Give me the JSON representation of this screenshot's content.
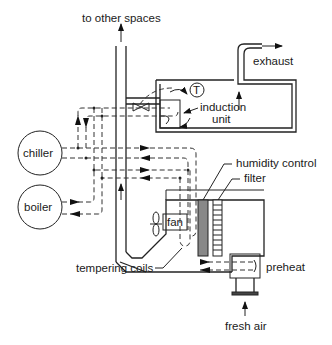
{
  "diagram": {
    "type": "HVAC induction system schematic",
    "labels": {
      "to_other_spaces": "to other spaces",
      "exhaust": "exhaust",
      "thermostat": "T",
      "induction_unit_line1": "induction",
      "induction_unit_line2": "unit",
      "chiller": "chiller",
      "boiler": "boiler",
      "humidity_control": "humidity control",
      "filter": "filter",
      "fan": "fan",
      "tempering_coils": "tempering coils",
      "preheat": "preheat",
      "fresh_air": "fresh air"
    },
    "colors": {
      "line": "#222222",
      "background": "#ffffff"
    }
  }
}
